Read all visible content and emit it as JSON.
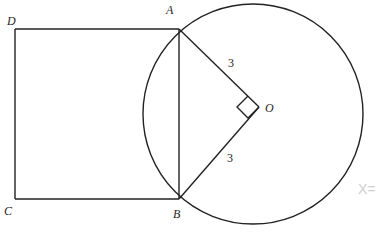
{
  "diagram": {
    "type": "geometry",
    "shapes": {
      "square": {
        "vertices": [
          "D",
          "A",
          "B",
          "C"
        ]
      },
      "circle": {
        "center": "O"
      },
      "chord": [
        "A",
        "B"
      ],
      "radii": [
        {
          "from": "O",
          "to": "A",
          "label": "3"
        },
        {
          "from": "O",
          "to": "B",
          "label": "3"
        }
      ],
      "right_angle_at": "O"
    },
    "labels": {
      "A": "A",
      "B": "B",
      "C": "C",
      "D": "D",
      "O": "O",
      "OA_length": "3",
      "OB_length": "3"
    },
    "handwritten_note": "X=",
    "colors": {
      "stroke": "#222222",
      "text": "#1e1e1e",
      "faint_note": "#cfcfcf",
      "background": "#ffffff"
    }
  }
}
